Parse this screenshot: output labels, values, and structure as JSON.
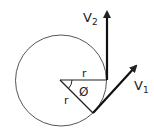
{
  "diagram": {
    "type": "vector-rotation",
    "labels": {
      "v2": "V",
      "v2_sub": "2",
      "v1": "V",
      "v1_sub": "1",
      "r_top": "r",
      "r_diag": "r",
      "angle": "Ø"
    },
    "colors": {
      "stroke": "#222222",
      "circle": "#555555",
      "background": "#ffffff"
    }
  }
}
